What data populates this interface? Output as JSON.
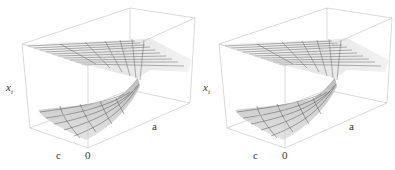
{
  "figure": {
    "panels": [
      {
        "id": "left",
        "axis_labels": {
          "vertical": "x",
          "vertical_sub": "i",
          "depth": "c",
          "origin": "0",
          "horizontal": "a"
        }
      },
      {
        "id": "right",
        "axis_labels": {
          "vertical": "x",
          "vertical_sub": "i",
          "depth": "c",
          "origin": "0",
          "horizontal": "a"
        }
      }
    ],
    "colors": {
      "box": "#c8c8c8",
      "surface_top": "#eeeeee",
      "surface_bottom": "#cfcfcf",
      "mesh": "#555555",
      "text": "#333333"
    }
  }
}
